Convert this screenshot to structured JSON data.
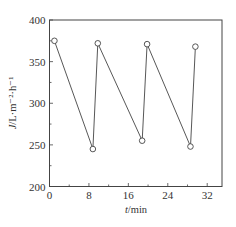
{
  "chart_data": {
    "type": "line",
    "title": "",
    "xlabel": "t/min",
    "ylabel": "J/L·m⁻²·h⁻¹",
    "xlim": [
      0,
      35
    ],
    "ylim": [
      200,
      400
    ],
    "xticks": [
      0,
      8,
      16,
      24,
      32
    ],
    "yticks": [
      200,
      250,
      300,
      350,
      400
    ],
    "x_minor_step": 4,
    "y_minor_step": 25,
    "grid": false,
    "legend": null,
    "marker": "open-circle",
    "series": [
      {
        "name": "flux",
        "x": [
          1.0,
          8.8,
          9.8,
          18.8,
          19.8,
          28.6,
          29.6
        ],
        "y": [
          375,
          245,
          372,
          255,
          371,
          248,
          368
        ]
      }
    ]
  },
  "labels": {
    "x_axis": "t/min",
    "y_axis_italic": "J",
    "y_axis_rest": "/L·m⁻²·h⁻¹"
  }
}
